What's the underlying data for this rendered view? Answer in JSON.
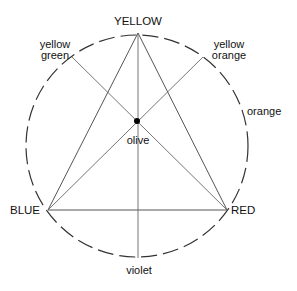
{
  "diagram": {
    "type": "color-wheel-triangle",
    "circle": {
      "cx": 137,
      "cy": 146,
      "r": 111,
      "style": "dashed"
    },
    "center_label": "olive",
    "points": {
      "yellow": {
        "label": "YELLOW",
        "x": 138,
        "y": 33
      },
      "blue": {
        "label": "BLUE",
        "x": 48,
        "y": 210
      },
      "red": {
        "label": "RED",
        "x": 227,
        "y": 210
      },
      "yellow_green": {
        "label_line1": "yellow",
        "label_line2": "green",
        "x": 72,
        "y": 57
      },
      "yellow_orange": {
        "label_line1": "yellow",
        "label_line2": "orange",
        "x": 203,
        "y": 57
      },
      "violet": {
        "label": "violet",
        "x": 138,
        "y": 258
      },
      "orange": {
        "label": "orange"
      },
      "olive": {
        "x": 137,
        "y": 121
      }
    },
    "colors": {
      "line": "#555555",
      "text": "#111111",
      "dot": "#000000",
      "background": "#ffffff"
    }
  }
}
